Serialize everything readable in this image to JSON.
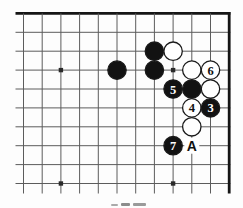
{
  "diagram": {
    "kind": "go-board-corner-diagram",
    "visible_move_numbers": [
      "3",
      "4",
      "5",
      "6",
      "7"
    ],
    "visible_point_letters": [
      "A"
    ],
    "caption_legible": false
  },
  "colors": {
    "background": "#fdfdfd",
    "grid_line": "#5c5c5c",
    "board_edge": "#151515",
    "black_stone": "#121212",
    "white_stone": "#ffffff",
    "stone_outline": "#1a1a1a",
    "number_on_white": "#111111",
    "number_on_black": "#ffffff",
    "marker_text": "#111111",
    "star_point": "#2a2a2a"
  },
  "board": {
    "cols": 12,
    "rows": 10,
    "x0": 23.5,
    "y0": 13.4,
    "dx": 18.7,
    "dy": 18.9,
    "h_line_x_start": 15.5,
    "h_line_x_end": 230.4,
    "v_line_y_end": 193.5,
    "thick_top_row": 1,
    "thick_right_col": 12,
    "stone_radius": 9.2,
    "hoshi": [
      [
        3,
        4
      ],
      [
        9,
        4
      ],
      [
        3,
        10
      ],
      [
        9,
        10
      ]
    ],
    "stones": [
      {
        "col": 6,
        "row": 4,
        "color": "black",
        "label": ""
      },
      {
        "col": 8,
        "row": 3,
        "color": "black",
        "label": ""
      },
      {
        "col": 8,
        "row": 4,
        "color": "black",
        "label": ""
      },
      {
        "col": 9,
        "row": 3,
        "color": "white",
        "label": ""
      },
      {
        "col": 10,
        "row": 4,
        "color": "white",
        "label": ""
      },
      {
        "col": 11,
        "row": 4,
        "color": "white",
        "label": "6"
      },
      {
        "col": 9,
        "row": 5,
        "color": "black",
        "label": "5"
      },
      {
        "col": 10,
        "row": 5,
        "color": "black",
        "label": ""
      },
      {
        "col": 11,
        "row": 5,
        "color": "white",
        "label": ""
      },
      {
        "col": 10,
        "row": 6,
        "color": "white",
        "label": "4"
      },
      {
        "col": 11,
        "row": 6,
        "color": "black",
        "label": "3"
      },
      {
        "col": 10,
        "row": 7,
        "color": "white",
        "label": ""
      },
      {
        "col": 9,
        "row": 8,
        "color": "black",
        "label": "7"
      }
    ],
    "markers": [
      {
        "col": 10,
        "row": 8,
        "label": "A"
      }
    ]
  }
}
